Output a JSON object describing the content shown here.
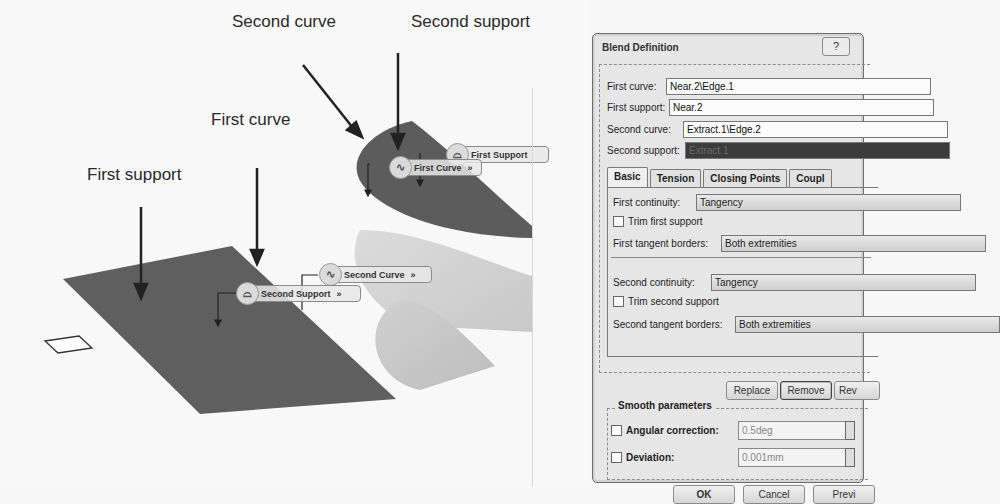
{
  "annotations": {
    "second_curve": "Second curve",
    "second_support": "Second support",
    "first_curve": "First curve",
    "first_support": "First support"
  },
  "viewport_tags": {
    "first_support": {
      "label": "First Support",
      "icon": "support-icon"
    },
    "first_curve": {
      "label": "First Curve",
      "chevron": "»",
      "icon": "curve-icon"
    },
    "second_curve": {
      "label": "Second Curve",
      "chevron": "»",
      "icon": "curve-icon"
    },
    "second_support": {
      "label": "Second Support",
      "chevron": "»",
      "icon": "support-icon"
    }
  },
  "dialog": {
    "title": "Blend Definition",
    "help_icon": "?",
    "fields": {
      "first_curve": {
        "label": "First curve:",
        "value": "Near.2\\Edge.1"
      },
      "first_support": {
        "label": "First support:",
        "value": "Near.2"
      },
      "second_curve": {
        "label": "Second curve:",
        "value": "Extract.1\\Edge.2"
      },
      "second_support": {
        "label": "Second support:",
        "value": "Extract.1"
      }
    },
    "tabs": [
      {
        "label": "Basic",
        "active": true
      },
      {
        "label": "Tension",
        "active": false
      },
      {
        "label": "Closing Points",
        "active": false
      },
      {
        "label": "Coupl",
        "active": false
      }
    ],
    "basic": {
      "first_continuity": {
        "label": "First continuity:",
        "value": "Tangency"
      },
      "trim_first_support": {
        "label": "Trim first support",
        "checked": false
      },
      "first_tangent_borders": {
        "label": "First tangent borders:",
        "value": "Both extremities"
      },
      "second_continuity": {
        "label": "Second continuity:",
        "value": "Tangency"
      },
      "trim_second_support": {
        "label": "Trim second support",
        "checked": false
      },
      "second_tangent_borders": {
        "label": "Second tangent borders:",
        "value": "Both extremities"
      }
    },
    "actions": {
      "replace": "Replace",
      "remove": "Remove",
      "reverse": "Rev"
    },
    "smooth": {
      "title": "Smooth parameters",
      "angular": {
        "label": "Angular correction:",
        "value": "0.5deg",
        "checked": false
      },
      "deviation": {
        "label": "Deviation:",
        "value": "0.001mm",
        "checked": false
      }
    },
    "buttons": {
      "ok": "OK",
      "cancel": "Cancel",
      "preview": "Previ"
    }
  }
}
